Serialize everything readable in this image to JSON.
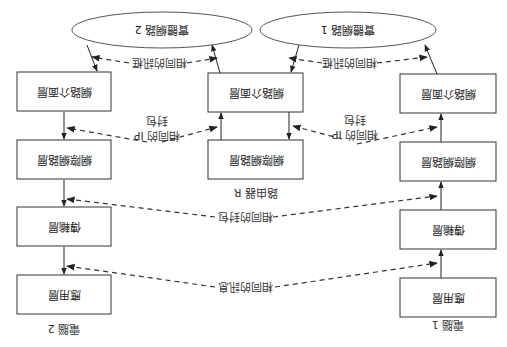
{
  "diagram": {
    "orientation": "rotated 180 degrees",
    "title": "",
    "networks": [
      {
        "id": "net1",
        "label": "實體網路 1"
      },
      {
        "id": "net2",
        "label": "實體網路 2"
      }
    ],
    "hosts": [
      {
        "id": "computer1",
        "label": "電腦 1",
        "layers": [
          "應用層",
          "傳輸層",
          "網際網路層",
          "網路介面層"
        ]
      },
      {
        "id": "computer2",
        "label": "電腦 2",
        "layers": [
          "應用層",
          "傳輸層",
          "網際網路層",
          "網路介面層"
        ]
      }
    ],
    "router": {
      "id": "routerR",
      "label": "路由器 R",
      "layers": [
        "網際網路層",
        "網路介面層"
      ]
    },
    "peer_labels": {
      "message": "相同的訊息",
      "packet": "相同的封包",
      "ip_packet_line1": "相同的 IP",
      "ip_packet_line2": "封包",
      "frame": "相同的訊框"
    },
    "colors": {
      "stroke": "#333333",
      "background": "#ffffff",
      "text": "#222222"
    }
  }
}
